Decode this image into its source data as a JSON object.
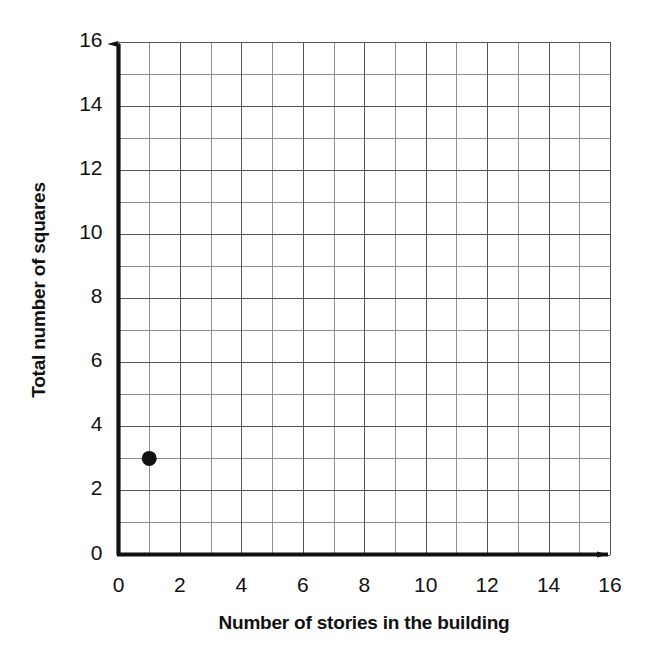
{
  "chart_data": {
    "type": "scatter",
    "title": "",
    "xlabel": "Number of stories in the building",
    "ylabel": "Total number of squares",
    "xlim": [
      0,
      16
    ],
    "ylim": [
      0,
      16
    ],
    "xticks": [
      0,
      2,
      4,
      6,
      8,
      10,
      12,
      14,
      16
    ],
    "yticks": [
      0,
      2,
      4,
      6,
      8,
      10,
      12,
      14,
      16
    ],
    "xtick_labels": [
      "0",
      "2",
      "4",
      "6",
      "8",
      "10",
      "12",
      "14",
      "16"
    ],
    "ytick_labels": [
      "0",
      "2",
      "4",
      "6",
      "8",
      "10",
      "12",
      "14",
      "16"
    ],
    "grid": true,
    "grid_minor_step": 1,
    "grid_major_step": 2,
    "legend": null,
    "points": [
      {
        "x": 1,
        "y": 3,
        "label": "(1, 3)"
      }
    ],
    "series": [
      {
        "name": "Squares per story",
        "x": [
          1
        ],
        "y": [
          3
        ]
      }
    ],
    "annotations": []
  },
  "style": {
    "background": "#ffffff",
    "axis_color": "#111111",
    "grid_minor_color": "#8a8a8a",
    "grid_major_color": "#5a5a5a",
    "point_color": "#111111",
    "tick_text_color": "#111111"
  },
  "axes": {
    "x_title": "Number of stories in the building",
    "y_title": "Total number of squares"
  }
}
